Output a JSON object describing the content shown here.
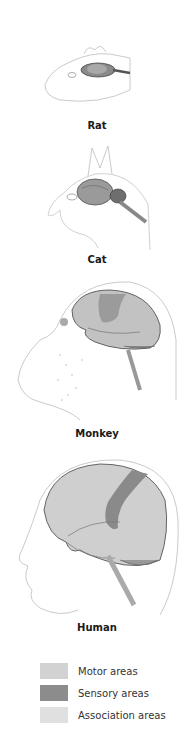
{
  "panels": [
    {
      "label": "Rat"
    },
    {
      "label": "Cat"
    },
    {
      "label": "Monkey"
    },
    {
      "label": "Human"
    }
  ],
  "legend": {
    "items": [
      {
        "label": "Motor areas",
        "color": "#d2d2d2"
      },
      {
        "label": "Sensory areas",
        "color": "#8c8c8c"
      },
      {
        "label": "Association areas",
        "color": "#e0e0e0"
      }
    ]
  },
  "colors": {
    "outline": "#b8b8b8",
    "brain_base": "#c8c8c8",
    "brain_dark": "#6e6e6e",
    "sensory": "#8a8a8a"
  }
}
